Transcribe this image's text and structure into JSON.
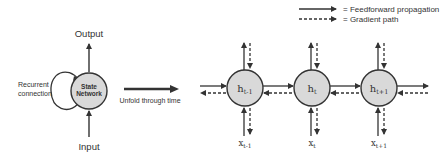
{
  "legend": {
    "items": [
      {
        "style": "solid",
        "label": "= Feedforward propagation"
      },
      {
        "style": "dashed",
        "label": "= Gradient path"
      }
    ]
  },
  "folded": {
    "output_label": "Output",
    "input_label": "Input",
    "recurrent_label_line1": "Recurrent",
    "recurrent_label_line2": "connection",
    "node_line1": "State",
    "node_line2": "Network"
  },
  "unfold": {
    "label": "Unfold through time"
  },
  "unfolded": {
    "nodes": [
      {
        "h": "h",
        "h_sub": "t-1",
        "x": "x",
        "x_sub": "t-1"
      },
      {
        "h": "h",
        "h_sub": "t",
        "x": "x",
        "x_sub": "t"
      },
      {
        "h": "h",
        "h_sub": "t+1",
        "x": "x",
        "x_sub": "t+1"
      }
    ]
  },
  "colors": {
    "node_fill": "#d9d9d9",
    "stroke": "#333333",
    "text": "#333333"
  }
}
